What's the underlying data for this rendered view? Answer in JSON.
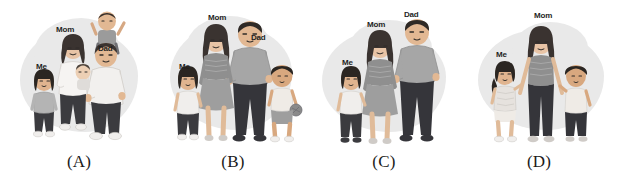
{
  "figure": {
    "kind": "multiple-choice-image-options",
    "background_color": "#ffffff",
    "blob_color": "#e9e9e9",
    "label_text_color": "#1f1f1f",
    "caption_color": "#1b1b1b",
    "palette": {
      "skin_light": "#e8c4a6",
      "skin_medium": "#d6a883",
      "hair_dark": "#3a3330",
      "hair_black": "#2b2622",
      "top_light": "#f2f0ee",
      "top_mid": "#a9a9a9",
      "top_dark": "#8f8f8f",
      "pants_dark": "#3b3b3f",
      "pants_mid": "#6f6f73",
      "outline": "#2f2b28",
      "shadow": "#d7d7d7"
    },
    "panels": [
      {
        "id": "A",
        "caption": "(A)",
        "members": [
          "Me",
          "Mom",
          "Baby",
          "Dad",
          "Boy"
        ],
        "labels": [
          {
            "text": "Me",
            "x": 36,
            "y": 62
          },
          {
            "text": "Mom",
            "x": 56,
            "y": 25
          },
          {
            "text": "Dad",
            "x": 98,
            "y": 44
          }
        ]
      },
      {
        "id": "B",
        "caption": "(B)",
        "members": [
          "Me",
          "Mom",
          "Dad",
          "Boy"
        ],
        "labels": [
          {
            "text": "Me",
            "x": 21,
            "y": 62
          },
          {
            "text": "Mom",
            "x": 50,
            "y": 13
          },
          {
            "text": "Dad",
            "x": 93,
            "y": 33
          }
        ]
      },
      {
        "id": "C",
        "caption": "(C)",
        "members": [
          "Me",
          "Mom",
          "Dad"
        ],
        "labels": [
          {
            "text": "Me",
            "x": 34,
            "y": 58
          },
          {
            "text": "Mom",
            "x": 59,
            "y": 20
          },
          {
            "text": "Dad",
            "x": 96,
            "y": 10
          }
        ]
      },
      {
        "id": "D",
        "caption": "(D)",
        "members": [
          "Me",
          "Mom",
          "Boy"
        ],
        "labels": [
          {
            "text": "Me",
            "x": 36,
            "y": 50
          },
          {
            "text": "Mom",
            "x": 74,
            "y": 11
          }
        ]
      }
    ]
  }
}
